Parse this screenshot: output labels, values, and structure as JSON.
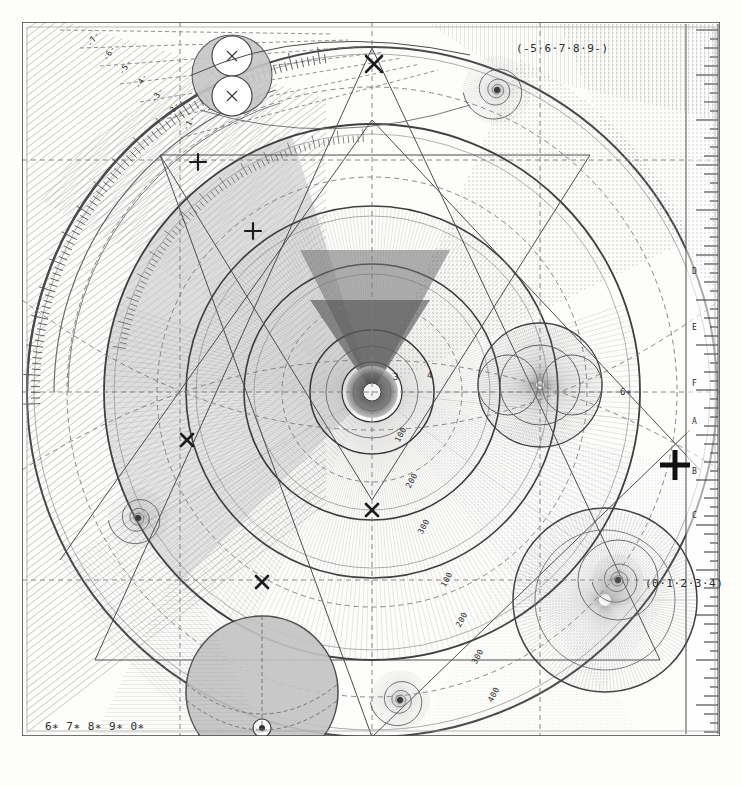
{
  "figure": {
    "title_top": "(-5·6·7·8·9-)",
    "title_bottom_right": "(0·1·2·3·4)",
    "title_bottom_left": "6∗ 7∗ 8∗ 9∗ 0∗",
    "label_mid_right": "6∗",
    "background": "#fdfdfc",
    "ink": "#3a3a3a",
    "ink_light": "#9a9a9a",
    "ink_mid": "#6e6e6e",
    "fill_grey": "#bdbdbd",
    "fill_grey_light": "#d8d8d8",
    "frame": "#555555"
  },
  "center_numbers": [
    "3",
    "4"
  ],
  "radial_scale_a": [
    "100",
    "200",
    "300"
  ],
  "radial_scale_b": [
    "100",
    "200",
    "300",
    "400"
  ],
  "ruler_right_letters": [
    "D",
    "E",
    "F",
    "A",
    "B",
    "C"
  ],
  "fan_labels": [
    "-7-",
    "-6-",
    "-5-",
    "-4-",
    "-3-",
    "-2-",
    "-1-"
  ],
  "markers": {
    "cross_x": "✕",
    "cross_plus": "+",
    "bold_plus": "✚"
  },
  "chart_data": {
    "type": "diagram",
    "elements": [
      {
        "name": "outer-frame",
        "kind": "rect",
        "x": 22,
        "y": 22,
        "w": 698,
        "h": 714
      },
      {
        "name": "main-circle-outer",
        "kind": "circle",
        "cx": 372,
        "cy": 392,
        "r": 345
      },
      {
        "name": "main-circle-2",
        "kind": "circle",
        "cx": 372,
        "cy": 392,
        "r": 268
      },
      {
        "name": "main-circle-3",
        "kind": "circle",
        "cx": 372,
        "cy": 392,
        "r": 185
      },
      {
        "name": "main-circle-4",
        "kind": "circle",
        "cx": 372,
        "cy": 392,
        "r": 128
      },
      {
        "name": "main-circle-5",
        "kind": "circle",
        "cx": 372,
        "cy": 392,
        "r": 62
      },
      {
        "name": "main-circle-6",
        "kind": "circle",
        "cx": 372,
        "cy": 392,
        "r": 30
      },
      {
        "name": "lower-big-circle",
        "kind": "circle",
        "cx": 262,
        "cy": 692,
        "r": 76
      },
      {
        "name": "right-large-circle",
        "kind": "circle",
        "cx": 605,
        "cy": 600,
        "r": 90
      },
      {
        "name": "right-mid-circle",
        "kind": "circle",
        "cx": 540,
        "cy": 385,
        "r": 62
      },
      {
        "name": "spiral-top-right",
        "kind": "spiral",
        "cx": 497,
        "cy": 90,
        "r": 34
      },
      {
        "name": "spiral-left",
        "kind": "spiral",
        "cx": 138,
        "cy": 518,
        "r": 30
      },
      {
        "name": "spiral-bottom",
        "kind": "spiral",
        "cx": 400,
        "cy": 700,
        "r": 30
      },
      {
        "name": "spiral-bottom-right",
        "kind": "spiral",
        "cx": 618,
        "cy": 580,
        "r": 26
      },
      {
        "name": "twin-circles-top",
        "kind": "circle-pair",
        "cx": 232,
        "cy": 75,
        "r": 27
      }
    ],
    "axis_scales": [
      {
        "name": "right-ruler",
        "orientation": "vertical",
        "ticks": 60,
        "letters": [
          "D",
          "E",
          "F",
          "A",
          "B",
          "C"
        ]
      },
      {
        "name": "left-arc-ruler",
        "orientation": "arc",
        "ticks": 90
      },
      {
        "name": "radial-ruler-a",
        "labels": [
          "100",
          "200",
          "300"
        ]
      },
      {
        "name": "radial-ruler-b",
        "labels": [
          "100",
          "200",
          "300",
          "400"
        ]
      }
    ]
  }
}
